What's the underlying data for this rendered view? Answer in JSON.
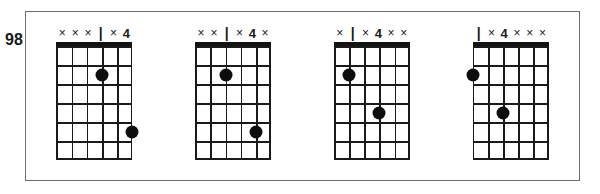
{
  "page": {
    "measure_number": "98",
    "background_color": "#ffffff",
    "frame_color": "#6e6e6e",
    "ink_color": "#1a1a1a",
    "dot_color": "#0d0d0d"
  },
  "diagram_spec": {
    "strings": 6,
    "frets": 6,
    "nut_shown": true,
    "marker_mute": "×",
    "marker_bar": "|"
  },
  "chords": [
    {
      "name": "chord-1",
      "markers": [
        {
          "type": "mute",
          "label": "×"
        },
        {
          "type": "mute",
          "label": "×"
        },
        {
          "type": "mute",
          "label": "×"
        },
        {
          "type": "bar",
          "label": "|"
        },
        {
          "type": "mute",
          "label": "×"
        },
        {
          "type": "finger",
          "label": "4"
        }
      ],
      "dots": [
        {
          "string": 4,
          "fret": 2
        },
        {
          "string": 6,
          "fret": 5
        }
      ]
    },
    {
      "name": "chord-2",
      "markers": [
        {
          "type": "mute",
          "label": "×"
        },
        {
          "type": "mute",
          "label": "×"
        },
        {
          "type": "bar",
          "label": "|"
        },
        {
          "type": "mute",
          "label": "×"
        },
        {
          "type": "finger",
          "label": "4"
        },
        {
          "type": "mute",
          "label": "×"
        }
      ],
      "dots": [
        {
          "string": 3,
          "fret": 2
        },
        {
          "string": 5,
          "fret": 5
        }
      ]
    },
    {
      "name": "chord-3",
      "markers": [
        {
          "type": "mute",
          "label": "×"
        },
        {
          "type": "bar",
          "label": "|"
        },
        {
          "type": "mute",
          "label": "×"
        },
        {
          "type": "finger",
          "label": "4"
        },
        {
          "type": "mute",
          "label": "×"
        },
        {
          "type": "mute",
          "label": "×"
        }
      ],
      "dots": [
        {
          "string": 2,
          "fret": 2
        },
        {
          "string": 4,
          "fret": 4
        }
      ]
    },
    {
      "name": "chord-4",
      "markers": [
        {
          "type": "bar",
          "label": "|"
        },
        {
          "type": "mute",
          "label": "×"
        },
        {
          "type": "finger",
          "label": "4"
        },
        {
          "type": "mute",
          "label": "×"
        },
        {
          "type": "mute",
          "label": "×"
        },
        {
          "type": "mute",
          "label": "×"
        }
      ],
      "dots": [
        {
          "string": 1,
          "fret": 2
        },
        {
          "string": 3,
          "fret": 4
        }
      ]
    }
  ]
}
